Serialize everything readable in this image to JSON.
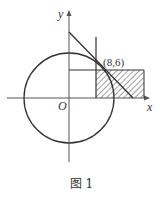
{
  "figure": {
    "caption": "图 1",
    "axes": {
      "x_label": "x",
      "y_label": "y",
      "origin_label": "O"
    },
    "point_label": "(8,6)",
    "elements": [
      "circle centered at origin",
      "tangent line through (8,6)",
      "line x=8",
      "line y=6",
      "shaded region x>=8, 0<=y<=6"
    ]
  }
}
